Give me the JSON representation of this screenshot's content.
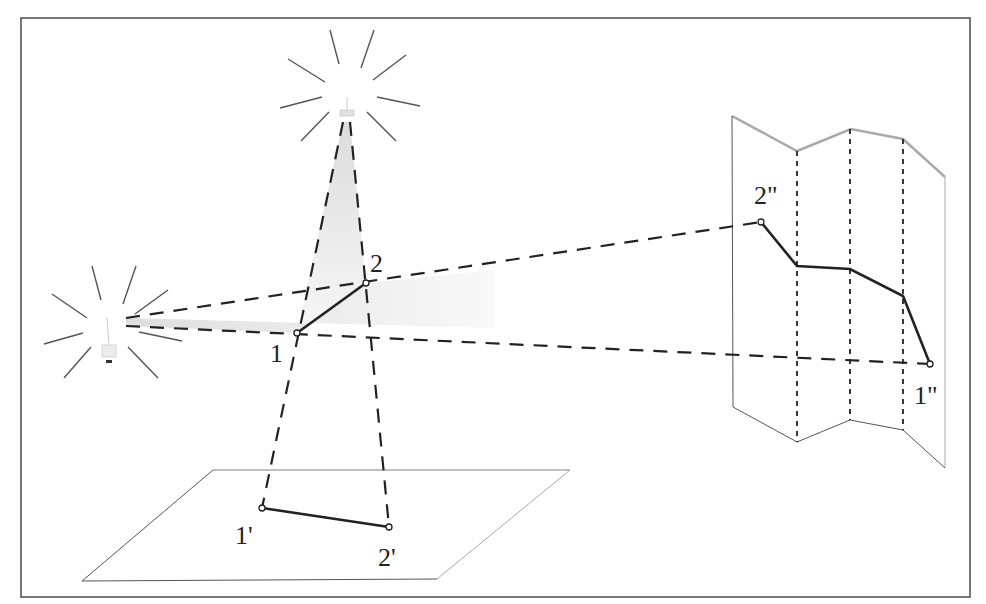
{
  "diagram": {
    "colors": {
      "frame": "#555555",
      "ray": "#222222",
      "segment": "#222222",
      "shade": "#e6e6e6",
      "plane": "#666666",
      "plane_far_edge": "#aaaaaa",
      "fold_line": "#222222",
      "rays_glow": "#555555"
    },
    "light_sources": [
      {
        "id": "top-lamp",
        "x": 346,
        "y": 108
      },
      {
        "id": "left-lamp",
        "x": 108,
        "y": 322
      }
    ],
    "points": {
      "p1": {
        "label": "1",
        "x": 297,
        "y": 333
      },
      "p2": {
        "label": "2",
        "x": 366,
        "y": 283
      },
      "p1_prime": {
        "label": "1'",
        "x": 262,
        "y": 508
      },
      "p2_prime": {
        "label": "2'",
        "x": 389,
        "y": 527
      },
      "p1_dprime": {
        "label": "1''",
        "x": 930,
        "y": 364
      },
      "p2_dprime": {
        "label": "2''",
        "x": 761,
        "y": 222
      }
    },
    "labels": {
      "p1": "1",
      "p2": "2",
      "p1_prime": "1'",
      "p2_prime": "2'",
      "p1_dprime": "1\"",
      "p2_dprime": "2\""
    }
  }
}
